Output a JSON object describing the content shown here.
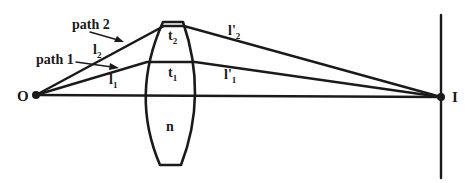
{
  "diagram": {
    "type": "optics ray diagram through a converging lens",
    "points": {
      "object": {
        "label": "O"
      },
      "image": {
        "label": "I"
      }
    },
    "lens": {
      "label": "n"
    },
    "paths": [
      {
        "name": "path 1",
        "label": "path 1",
        "segment_before": {
          "base": "l",
          "sub": "1"
        },
        "thickness": {
          "base": "t",
          "sub": "1"
        },
        "segment_after": {
          "base": "l'",
          "sub": "1"
        }
      },
      {
        "name": "path 2",
        "label": "path 2",
        "segment_before": {
          "base": "l",
          "sub": "2"
        },
        "thickness": {
          "base": "t",
          "sub": "2"
        },
        "segment_after": {
          "base": "l'",
          "sub": "2"
        }
      }
    ],
    "colors": {
      "ink": "#1a1a1a",
      "background": "#ffffff"
    }
  }
}
